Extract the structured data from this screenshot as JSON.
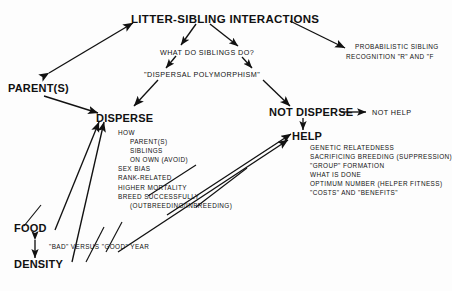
{
  "diagram": {
    "type": "concept-flow-diagram",
    "title": "LITTER-SIBLING INTERACTIONS",
    "background_color": "#fdfdfd",
    "ink_color": "#111111",
    "nodes": {
      "title": "LITTER-SIBLING INTERACTIONS",
      "question": "WHAT DO SIBLINGS DO?",
      "polymorphism": "\"DISPERSAL POLYMORPHISM\"",
      "parents": "PARENT(S)",
      "disperse": "DISPERSE",
      "not_disperse": "NOT DISPERSE",
      "not_help": "NOT HELP",
      "help": "HELP",
      "food": "FOOD",
      "density": "DENSITY",
      "year_quality": "\"BAD\" VERSUS \"GOOD\" YEAR",
      "probabilistic": {
        "line1": "PROBABILISTIC SIBLING",
        "line2": "RECOGNITION \"R\" AND \"F"
      }
    },
    "disperse_list": [
      {
        "text": "HOW",
        "indent": 0
      },
      {
        "text": "PARENT(S)",
        "indent": 1
      },
      {
        "text": "SIBLINGS",
        "indent": 1
      },
      {
        "text": "ON OWN (AVOID)",
        "indent": 1
      },
      {
        "text": "SEX BIAS",
        "indent": 0
      },
      {
        "text": "RANK-RELATED",
        "indent": 0
      },
      {
        "text": "HIGHER MORTALITY",
        "indent": 0
      },
      {
        "text": "BREED SUCCESSFULLY",
        "indent": 0
      },
      {
        "text": "(OUTBREEDING/INBREEDING)",
        "indent": 1
      }
    ],
    "help_list": [
      {
        "text": "GENETIC RELATEDNESS"
      },
      {
        "text": "SACRIFICING BREEDING (SUPPRESSION)"
      },
      {
        "text": "\"GROUP\" FORMATION"
      },
      {
        "text": "WHAT IS DONE"
      },
      {
        "text": "OPTIMUM NUMBER (HELPER FITNESS)"
      },
      {
        "text": "\"COSTS\" AND \"BENEFITS\""
      }
    ]
  }
}
